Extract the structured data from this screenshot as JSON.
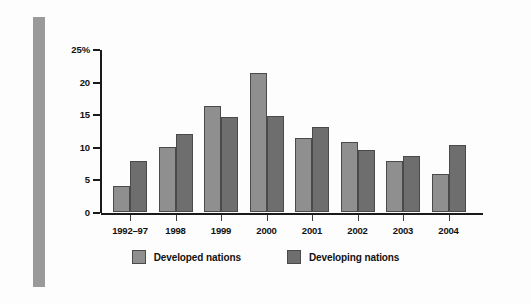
{
  "chart_data": {
    "type": "bar",
    "title": "",
    "xlabel": "",
    "ylabel": "",
    "ylim": [
      0,
      25
    ],
    "yticks": [
      0,
      5,
      10,
      15,
      20,
      25
    ],
    "ytick_labels": [
      "0",
      "5",
      "10",
      "15",
      "20",
      "25%"
    ],
    "grid": false,
    "legend_position": "bottom-center",
    "categories": [
      "1992–97",
      "1998",
      "1999",
      "2000",
      "2001",
      "2002",
      "2003",
      "2004"
    ],
    "series": [
      {
        "name": "Developed nations",
        "color": "#8f8f8f",
        "values": [
          4.0,
          10.0,
          16.2,
          21.3,
          11.4,
          10.7,
          7.8,
          5.9
        ]
      },
      {
        "name": "Developing nations",
        "color": "#6e6e6e",
        "values": [
          7.8,
          12.0,
          14.5,
          14.8,
          13.0,
          9.5,
          8.6,
          10.3
        ]
      }
    ]
  },
  "legend": {
    "items": [
      {
        "label": "Developed nations",
        "swatch": "developed"
      },
      {
        "label": "Developing nations",
        "swatch": "developing"
      }
    ]
  }
}
